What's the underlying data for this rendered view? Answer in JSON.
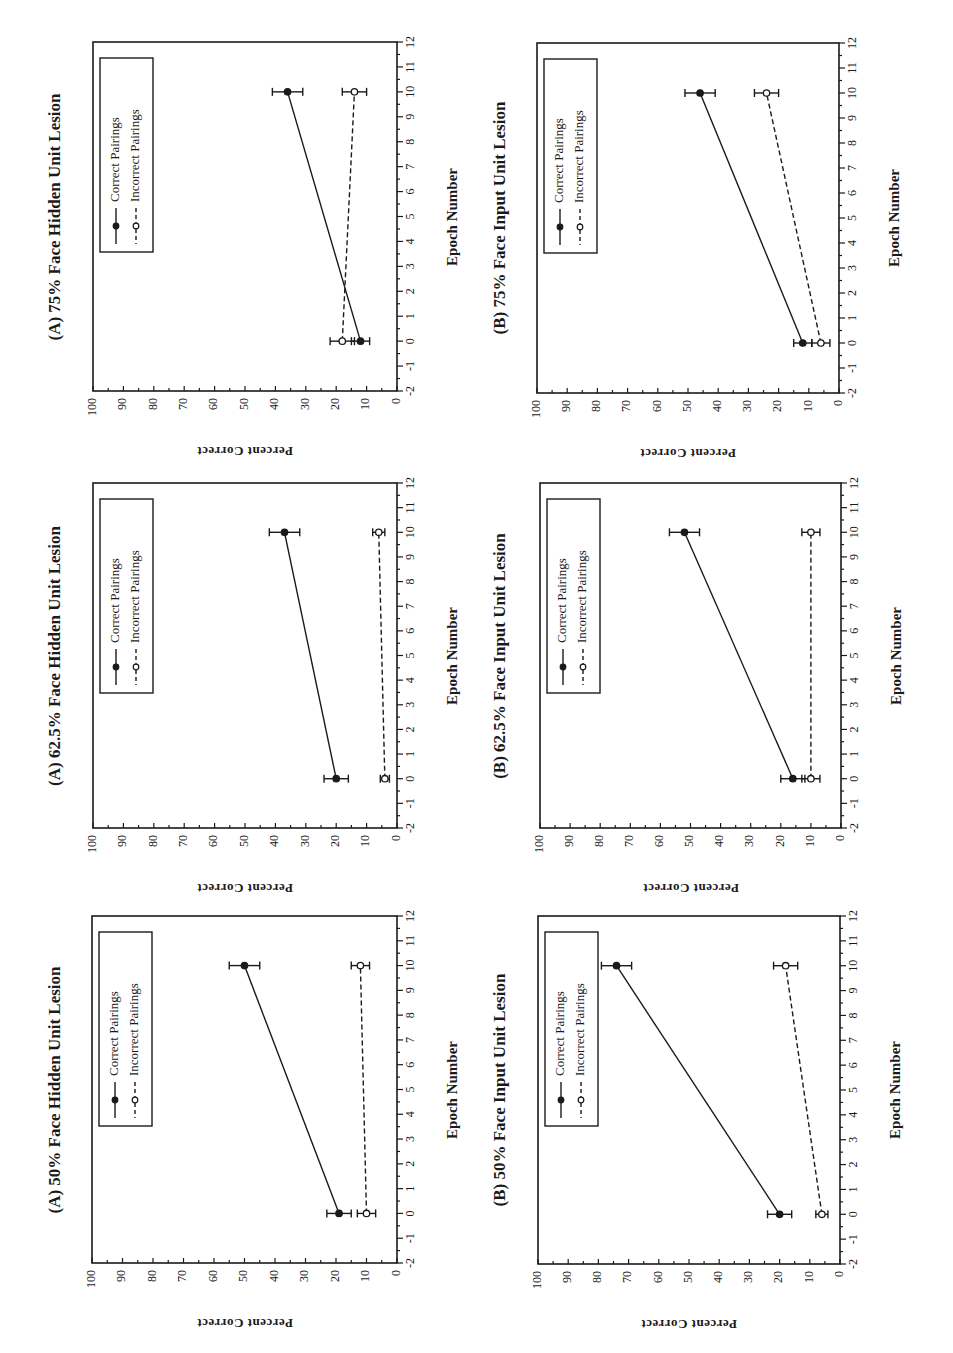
{
  "figure": {
    "orientation": "rotated-90-ccw",
    "ylabel": "Percent Correct",
    "xlabel": "Epoch Number",
    "legend": {
      "correct": "Correct Pairings",
      "incorrect": "Incorrect Pairings"
    },
    "y_ticks": [
      "0",
      "10",
      "20",
      "30",
      "40",
      "50",
      "60",
      "70",
      "80",
      "90",
      "100"
    ],
    "x_ticks": [
      "-2",
      "-1",
      "0",
      "1",
      "2",
      "3",
      "4",
      "5",
      "6",
      "7",
      "8",
      "9",
      "10",
      "11",
      "12"
    ],
    "colors": {
      "ink": "#1a1a1a",
      "background": "#ffffff"
    }
  },
  "panels": [
    {
      "id": "A75",
      "title": "(A) 75% Face Hidden Unit Lesion"
    },
    {
      "id": "A625",
      "title": "(A) 62.5% Face Hidden Unit Lesion"
    },
    {
      "id": "A50",
      "title": "(A) 50% Face Hidden Unit Lesion"
    },
    {
      "id": "B75",
      "title": "(B) 75% Face Input Unit Lesion"
    },
    {
      "id": "B625",
      "title": "(B) 62.5% Face Input Unit Lesion"
    },
    {
      "id": "B50",
      "title": "(B) 50% Face Input Unit Lesion"
    }
  ],
  "chart_data": [
    {
      "type": "line",
      "title": "(A) 75% Face Hidden Unit Lesion",
      "xlabel": "Epoch Number",
      "ylabel": "Percent Correct",
      "xlim": [
        -2,
        12
      ],
      "ylim": [
        0,
        100
      ],
      "grid": false,
      "legend_position": "upper-left (rotated)",
      "x": [
        0,
        10
      ],
      "series": [
        {
          "name": "Correct Pairings",
          "style": "solid-filled-circle",
          "values": [
            12,
            36
          ],
          "error": [
            3,
            5
          ]
        },
        {
          "name": "Incorrect Pairings",
          "style": "dashed-open-circle",
          "values": [
            18,
            14
          ],
          "error": [
            4,
            4
          ]
        }
      ]
    },
    {
      "type": "line",
      "title": "(A) 62.5% Face Hidden Unit Lesion",
      "xlabel": "Epoch Number",
      "ylabel": "Percent Correct",
      "xlim": [
        -2,
        12
      ],
      "ylim": [
        0,
        100
      ],
      "grid": false,
      "legend_position": "upper-left (rotated)",
      "x": [
        0,
        10
      ],
      "series": [
        {
          "name": "Correct Pairings",
          "style": "solid-filled-circle",
          "values": [
            20,
            37
          ],
          "error": [
            4,
            5
          ]
        },
        {
          "name": "Incorrect Pairings",
          "style": "dashed-open-circle",
          "values": [
            4,
            6
          ],
          "error": [
            1.5,
            2
          ]
        }
      ]
    },
    {
      "type": "line",
      "title": "(A) 50% Face Hidden Unit Lesion",
      "xlabel": "Epoch Number",
      "ylabel": "Percent Correct",
      "xlim": [
        -2,
        12
      ],
      "ylim": [
        0,
        100
      ],
      "grid": false,
      "legend_position": "upper-left (rotated)",
      "x": [
        0,
        10
      ],
      "series": [
        {
          "name": "Correct Pairings",
          "style": "solid-filled-circle",
          "values": [
            19,
            50
          ],
          "error": [
            4,
            5
          ]
        },
        {
          "name": "Incorrect Pairings",
          "style": "dashed-open-circle",
          "values": [
            10,
            12
          ],
          "error": [
            3,
            3
          ]
        }
      ]
    },
    {
      "type": "line",
      "title": "(B) 75% Face Input Unit Lesion",
      "xlabel": "Epoch Number",
      "ylabel": "Percent Correct",
      "xlim": [
        -2,
        12
      ],
      "ylim": [
        0,
        100
      ],
      "grid": false,
      "legend_position": "upper-left (rotated)",
      "x": [
        0,
        10
      ],
      "series": [
        {
          "name": "Correct Pairings",
          "style": "solid-filled-circle",
          "values": [
            12,
            46
          ],
          "error": [
            3,
            5
          ]
        },
        {
          "name": "Incorrect Pairings",
          "style": "dashed-open-circle",
          "values": [
            6,
            24
          ],
          "error": [
            3,
            4
          ]
        }
      ]
    },
    {
      "type": "line",
      "title": "(B) 62.5% Face Input Unit Lesion",
      "xlabel": "Epoch Number",
      "ylabel": "Percent Correct",
      "xlim": [
        -2,
        12
      ],
      "ylim": [
        0,
        100
      ],
      "grid": false,
      "legend_position": "upper-left (rotated)",
      "x": [
        0,
        10
      ],
      "series": [
        {
          "name": "Correct Pairings",
          "style": "solid-filled-circle",
          "values": [
            16,
            52
          ],
          "error": [
            4,
            5
          ]
        },
        {
          "name": "Incorrect Pairings",
          "style": "dashed-open-circle",
          "values": [
            10,
            10
          ],
          "error": [
            3,
            3
          ]
        }
      ]
    },
    {
      "type": "line",
      "title": "(B) 50% Face Input Unit Lesion",
      "xlabel": "Epoch Number",
      "ylabel": "Percent Correct",
      "xlim": [
        -2,
        12
      ],
      "ylim": [
        0,
        100
      ],
      "grid": false,
      "legend_position": "upper-left (rotated)",
      "x": [
        0,
        10
      ],
      "series": [
        {
          "name": "Correct Pairings",
          "style": "solid-filled-circle",
          "values": [
            20,
            74
          ],
          "error": [
            4,
            5
          ]
        },
        {
          "name": "Incorrect Pairings",
          "style": "dashed-open-circle",
          "values": [
            6,
            18
          ],
          "error": [
            2,
            4
          ]
        }
      ]
    }
  ]
}
